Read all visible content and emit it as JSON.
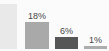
{
  "chart_data": {
    "type": "bar",
    "title": "",
    "subtitle": "",
    "xlabel": "",
    "ylabel": "",
    "categories": [
      "",
      "",
      "",
      ""
    ],
    "values": [
      null,
      18,
      6,
      1
    ],
    "value_labels": [
      "",
      "18%",
      "6%",
      "1%"
    ],
    "ylim": [
      0,
      30
    ],
    "grid": false,
    "legend": null,
    "bar_colors": [
      "#e9e9e9",
      "#a9a9a9",
      "#565656",
      "#adadad"
    ],
    "label_color": "#454545",
    "background": "#fbfbfb"
  },
  "labels": {
    "bar_0": "",
    "bar_1": "18%",
    "bar_2": "6%",
    "bar_3": "1%"
  }
}
